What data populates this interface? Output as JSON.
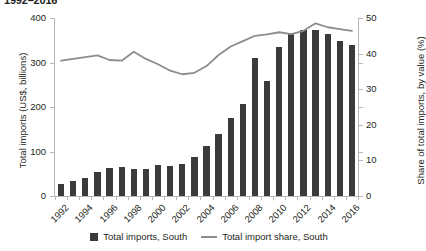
{
  "chart_data": {
    "type": "bar",
    "title": "1992–2016",
    "xlabel": "",
    "ylabel": "Total imports (US$, billions)",
    "y2label": "Share of total imports, by value (%)",
    "grid": false,
    "legend_position": "bottom-center",
    "ylim": [
      0,
      400
    ],
    "y2lim": [
      0,
      50
    ],
    "yticks": [
      "0",
      "100",
      "200",
      "300",
      "400"
    ],
    "ytick_values": [
      0,
      100,
      200,
      300,
      400
    ],
    "y2ticks": [
      "0",
      "10",
      "20",
      "30",
      "40",
      "50"
    ],
    "y2tick_values": [
      0,
      10,
      20,
      30,
      40,
      50
    ],
    "x": [
      1992,
      1993,
      1994,
      1995,
      1996,
      1997,
      1998,
      1999,
      2000,
      2001,
      2002,
      2003,
      2004,
      2005,
      2006,
      2007,
      2008,
      2009,
      2010,
      2011,
      2012,
      2013,
      2014,
      2015,
      2016
    ],
    "categories": [
      "1992",
      "1993",
      "1994",
      "1995",
      "1996",
      "1997",
      "1998",
      "1999",
      "2000",
      "2001",
      "2002",
      "2003",
      "2004",
      "2005",
      "2006",
      "2007",
      "2008",
      "2009",
      "2010",
      "2011",
      "2012",
      "2013",
      "2014",
      "2015",
      "2016"
    ],
    "xtick_labels": [
      "1992",
      "1994",
      "1996",
      "1998",
      "2000",
      "2002",
      "2004",
      "2006",
      "2008",
      "2010",
      "2012",
      "2014",
      "2016"
    ],
    "xtick_label_rotation": -45,
    "series": [
      {
        "name": "Total imports, South",
        "type": "bar",
        "axis": "left",
        "unit": "US$ billions",
        "color": "#3b3b3b",
        "values": [
          27,
          33,
          40,
          53,
          62,
          65,
          60,
          60,
          70,
          67,
          73,
          88,
          113,
          140,
          175,
          207,
          310,
          258,
          335,
          367,
          372,
          372,
          365,
          348,
          340
        ]
      },
      {
        "name": "Total import share, South",
        "type": "line",
        "axis": "right",
        "unit": "%",
        "color": "#8c8c8c",
        "values": [
          38.0,
          38.5,
          39.0,
          39.5,
          38.2,
          38.0,
          40.5,
          38.5,
          37.0,
          35.2,
          34.2,
          34.6,
          36.5,
          39.6,
          42.0,
          43.5,
          45.0,
          45.4,
          46.0,
          45.5,
          46.4,
          48.5,
          47.4,
          46.9,
          46.4
        ]
      }
    ]
  },
  "legend": {
    "items": [
      {
        "label": "Total imports, South",
        "marker": "square-swatch-icon"
      },
      {
        "label": "Total import share, South",
        "marker": "line-swatch-icon"
      }
    ]
  }
}
